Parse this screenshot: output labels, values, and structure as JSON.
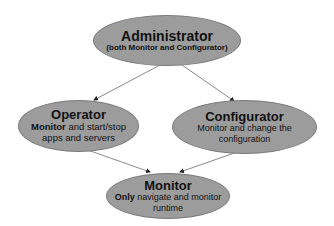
{
  "diagram": {
    "nodes": [
      {
        "id": "administrator",
        "title": "Administrator",
        "desc_bold": "",
        "desc": "(both Monitor and Configurator)"
      },
      {
        "id": "operator",
        "title": "Operator",
        "desc_bold": "Monitor",
        "desc": " and start/stop apps and servers"
      },
      {
        "id": "configurator",
        "title": "Configurator",
        "desc_bold": "Monitor",
        "desc": " and change the configuration"
      },
      {
        "id": "monitor",
        "title": "Monitor",
        "desc_bold": "Only",
        "desc": " navigate and monitor runtime"
      }
    ],
    "edges": [
      {
        "from": "administrator",
        "to": "operator"
      },
      {
        "from": "administrator",
        "to": "configurator"
      },
      {
        "from": "operator",
        "to": "monitor"
      },
      {
        "from": "configurator",
        "to": "monitor"
      }
    ],
    "colors": {
      "node_fill": "#9c9c9c",
      "node_stroke": "#7a7a7a",
      "edge": "#8a8a8a",
      "background": "#ffffff"
    }
  }
}
